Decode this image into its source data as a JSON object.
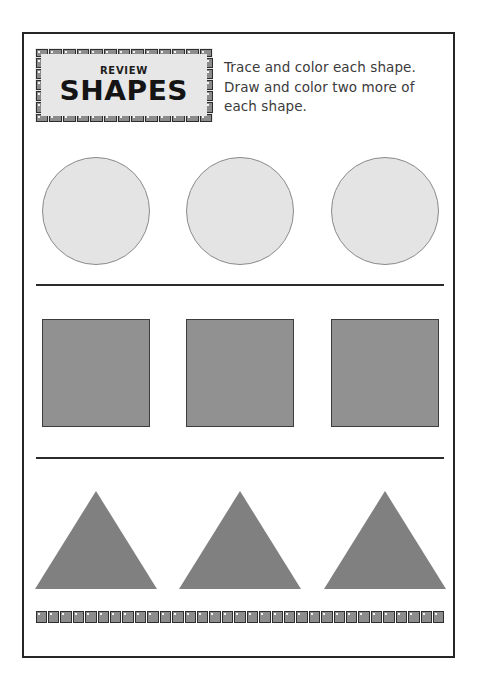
{
  "worksheet": {
    "title_label": "SHAPES",
    "subtitle_label": "REVIEW",
    "instructions": "Trace and color each shape. Draw and color two more of each shape.",
    "page_size": {
      "width": 477,
      "height": 678
    },
    "colors": {
      "page_background": "#ffffff",
      "frame_border": "#262626",
      "title_box_fill": "#e7e7e7",
      "tile_fill": "#8c8c8c",
      "tile_border": "#2e2e2e",
      "circle_fill": "#e4e4e4",
      "circle_border": "#8a8a8a",
      "square_fill": "#919191",
      "square_border": "#3d3d3d",
      "triangle_fill": "#808080",
      "separator": "#2b2b2b",
      "text": "#3b3b3b"
    },
    "rows": [
      {
        "name": "circles",
        "shape": "circle",
        "count": 3,
        "fill": "#e4e4e4",
        "size": 108
      },
      {
        "name": "squares",
        "shape": "square",
        "count": 3,
        "fill": "#919191",
        "size": 108
      },
      {
        "name": "triangles",
        "shape": "triangle",
        "count": 3,
        "fill": "#808080",
        "base": 122,
        "height": 98
      }
    ],
    "separators": 2,
    "title_border_tiles": {
      "top": 13,
      "bottom": 13,
      "left": 5,
      "right": 5
    },
    "footer_tiles": 33
  }
}
